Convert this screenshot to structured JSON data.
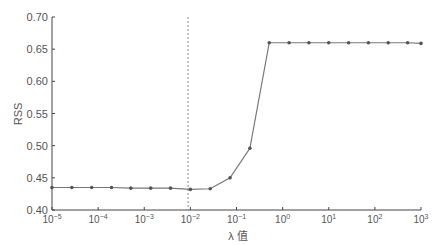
{
  "chart_data": {
    "type": "line",
    "title": "",
    "xlabel": "λ 值",
    "ylabel": "RSS",
    "xscale": "log",
    "xlim_exp": [
      -5,
      3
    ],
    "ylim": [
      0.4,
      0.7
    ],
    "xticks": [
      "10^-5",
      "10^-4",
      "10^-3",
      "10^-2",
      "10^-1",
      "10^0",
      "10^1",
      "10^2",
      "10^3"
    ],
    "xtick_exps": [
      -5,
      -4,
      -3,
      -2,
      -1,
      0,
      1,
      2,
      3
    ],
    "yticks": [
      "0.40",
      "0.45",
      "0.50",
      "0.55",
      "0.60",
      "0.65",
      "0.70"
    ],
    "ytick_values": [
      0.4,
      0.45,
      0.5,
      0.55,
      0.6,
      0.65,
      0.7
    ],
    "grid": false,
    "legend": null,
    "reference_line": {
      "orientation": "vertical",
      "style": "dashed",
      "x_exp": -2.05,
      "label": "optimal λ ≈ 10^-2"
    },
    "series": [
      {
        "name": "RSS",
        "marker": "circle",
        "color": "#666666",
        "x_exp": [
          -5.0,
          -4.57,
          -4.14,
          -3.71,
          -3.29,
          -2.86,
          -2.43,
          -2.0,
          -1.57,
          -1.14,
          -0.71,
          -0.29,
          0.14,
          0.57,
          1.0,
          1.43,
          1.86,
          2.29,
          2.71,
          3.0
        ],
        "values": [
          0.435,
          0.435,
          0.435,
          0.435,
          0.434,
          0.434,
          0.434,
          0.432,
          0.433,
          0.45,
          0.496,
          0.66,
          0.66,
          0.66,
          0.66,
          0.66,
          0.66,
          0.66,
          0.66,
          0.659
        ]
      }
    ]
  },
  "colors": {
    "axis": "#444444",
    "line": "#777777",
    "marker": "#555555",
    "dashed": "#888888",
    "text": "#555555"
  }
}
